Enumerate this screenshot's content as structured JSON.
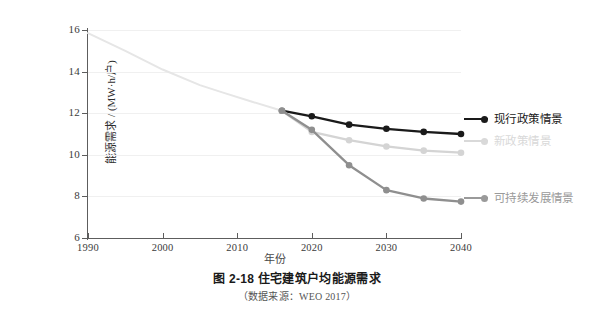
{
  "chart_data": {
    "type": "line",
    "title": "住宅建筑户均能源需求",
    "figure_number": "图 2-18",
    "source_note": "（数据来源：WEO 2017）",
    "xlabel": "年份",
    "ylabel": "能源需求 / (MW·h/户)",
    "xlim": [
      1990,
      2040
    ],
    "ylim": [
      6,
      16
    ],
    "xticks": [
      1990,
      2000,
      2010,
      2020,
      2030,
      2040
    ],
    "yticks": [
      16,
      14,
      12,
      10,
      8,
      6
    ],
    "xtick_labels": [
      "1990",
      "2000",
      "2010",
      "2020",
      "2030",
      "2040"
    ],
    "ytick_labels": [
      "16",
      "14",
      "12",
      "10",
      "8",
      "6"
    ],
    "grid": true,
    "grid_axis": "y",
    "legend_position": "right-inside",
    "series": [
      {
        "name": "历史数据",
        "color": "#e6e6e6",
        "show_in_legend": false,
        "markers": false,
        "x": [
          1990,
          1995,
          2000,
          2005,
          2008,
          2012,
          2016
        ],
        "values": [
          15.85,
          15.0,
          14.1,
          13.35,
          13.0,
          12.55,
          12.12
        ]
      },
      {
        "name": "现行政策情景",
        "color": "#1a1a1a",
        "show_in_legend": true,
        "markers": true,
        "x": [
          2016,
          2020,
          2025,
          2030,
          2035,
          2040
        ],
        "values": [
          12.12,
          11.85,
          11.45,
          11.25,
          11.1,
          11.0
        ]
      },
      {
        "name": "新政策情景",
        "color": "#d4d4d4",
        "show_in_legend": true,
        "markers": true,
        "x": [
          2016,
          2020,
          2025,
          2030,
          2035,
          2040
        ],
        "values": [
          12.12,
          11.1,
          10.7,
          10.4,
          10.2,
          10.1
        ]
      },
      {
        "name": "可持续发展情景",
        "color": "#8f8f8f",
        "show_in_legend": true,
        "markers": true,
        "x": [
          2016,
          2020,
          2025,
          2030,
          2035,
          2040
        ],
        "values": [
          12.12,
          11.2,
          9.5,
          8.3,
          7.9,
          7.75
        ]
      }
    ]
  },
  "legend": {
    "items": [
      {
        "label": "现行政策情景",
        "color": "#1a1a1a"
      },
      {
        "label": "新政策情景",
        "color": "#d9d9d9"
      },
      {
        "label": "可持续发展情景",
        "color": "#9a9a9a"
      }
    ]
  },
  "axes": {
    "ylabel": "能源需求 / (MW·h/户)",
    "xlabel": "年份",
    "ytick_labels": [
      "16",
      "14",
      "12",
      "10",
      "8",
      "6"
    ],
    "xtick_labels": [
      "1990",
      "2000",
      "2010",
      "2020",
      "2030",
      "2040"
    ]
  },
  "caption": {
    "main": "图 2-18   住宅建筑户均能源需求",
    "sub": "（数据来源：WEO 2017）"
  },
  "colors": {
    "current_policies": "#1a1a1a",
    "new_policies": "#d9d9d9",
    "sustainable_development": "#9a9a9a",
    "historical": "#e6e6e6",
    "axis": "#5d5d5d",
    "grid": "#f0f0f0"
  }
}
